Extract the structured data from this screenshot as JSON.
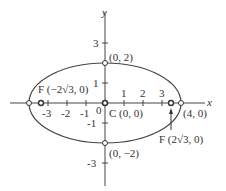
{
  "figure": {
    "type": "ellipse",
    "equation_params": {
      "a": 4,
      "b": 2,
      "c": "2√3"
    },
    "axes": {
      "x_label": "x",
      "y_label": "y"
    },
    "x_ticks": [
      "-3",
      "-2",
      "-1",
      "0",
      "1",
      "2",
      "3"
    ],
    "y_ticks": [
      "3",
      "1",
      "-1",
      "-3"
    ],
    "points": {
      "top_vertex": "(0, 2)",
      "bottom_vertex": "(0, −2)",
      "right_vertex": "(4, 0)",
      "center": "C (0, 0)",
      "left_focus": "F (−2√3, 0)",
      "right_focus": "F (2√3, 0)"
    },
    "colors": {
      "stroke": "#444444",
      "text": "#333333",
      "background": "#ffffff"
    }
  }
}
